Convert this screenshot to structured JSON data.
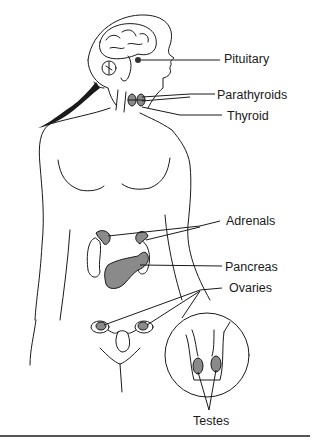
{
  "diagram": {
    "colors": {
      "line": "#1a1a1a",
      "gland_fill": "#8a8a8a",
      "background": "#ffffff"
    },
    "labels": {
      "pituitary": "Pituitary",
      "parathyroids": "Parathyroids",
      "thyroid": "Thyroid",
      "adrenals": "Adrenals",
      "pancreas": "Pancreas",
      "ovaries": "Ovaries",
      "testes": "Testes"
    }
  }
}
